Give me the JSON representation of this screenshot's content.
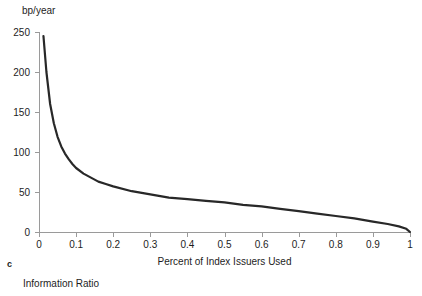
{
  "figure": {
    "panel_letter": "c",
    "caption": "Information Ratio",
    "curve_color": "#282828",
    "axis_color": "#9a9a9a",
    "text_color": "#1d1d1d"
  },
  "chart_data": {
    "type": "line",
    "title": "",
    "subtitle": "",
    "xlabel": "Percent of Index Issuers Used",
    "ylabel": "bp/year",
    "ylabel_position": "top-left",
    "xlim": [
      0,
      1
    ],
    "ylim": [
      0,
      250
    ],
    "grid": false,
    "legend": null,
    "legend_position": "none",
    "xticks": [
      0,
      0.1,
      0.2,
      0.3,
      0.4,
      0.5,
      0.6,
      0.7,
      0.8,
      0.9,
      1
    ],
    "xtick_labels": [
      "0",
      "0.1",
      "0.2",
      "0.3",
      "0.4",
      "0.5",
      "0.6",
      "0.7",
      "0.8",
      "0.9",
      "1"
    ],
    "yticks": [
      0,
      50,
      100,
      150,
      200,
      250
    ],
    "ytick_labels": [
      "0",
      "50",
      "100",
      "150",
      "200",
      "250"
    ],
    "series": [
      {
        "name": "Tracking error",
        "x": [
          0.012,
          0.02,
          0.03,
          0.04,
          0.05,
          0.06,
          0.07,
          0.08,
          0.09,
          0.1,
          0.12,
          0.14,
          0.16,
          0.18,
          0.2,
          0.25,
          0.3,
          0.35,
          0.4,
          0.45,
          0.5,
          0.55,
          0.6,
          0.65,
          0.7,
          0.75,
          0.8,
          0.85,
          0.9,
          0.94,
          0.97,
          0.99,
          1.0
        ],
        "y": [
          245,
          200,
          160,
          136,
          119,
          107,
          98,
          91,
          85,
          80,
          73,
          68,
          63,
          60,
          57,
          51,
          47,
          43,
          41,
          39,
          37,
          34,
          32,
          29,
          26,
          23,
          20,
          17,
          13,
          10,
          7,
          4,
          0
        ]
      }
    ],
    "annotations": []
  }
}
